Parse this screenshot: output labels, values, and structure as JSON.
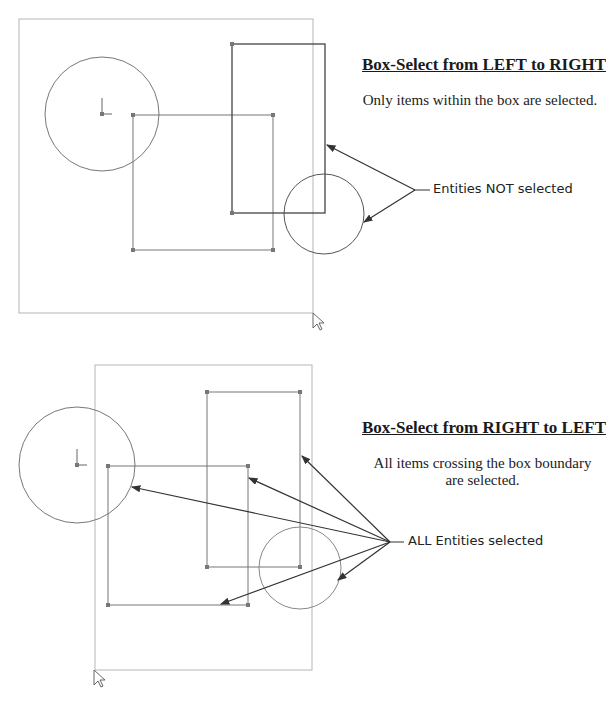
{
  "panels": [
    {
      "title": "Box-Select from LEFT to RIGHT",
      "description": "Only items within the box are selected.",
      "callout": "Entities NOT selected"
    },
    {
      "title": "Box-Select from RIGHT to LEFT",
      "description": "All items crossing the box boundary are selected.",
      "callout": "ALL Entities selected"
    }
  ],
  "icons": {
    "cursor": "arrow-cursor-icon",
    "origin": "origin-axes-icon"
  },
  "colors": {
    "geometry": "#6e6e6e",
    "selection_box": "#b0b0b0",
    "arrow": "#333333",
    "point": "#777777"
  }
}
